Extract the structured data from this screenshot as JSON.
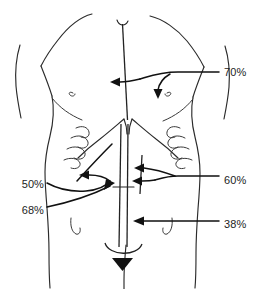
{
  "figure": {
    "type": "anatomical-line-diagram",
    "background_color": "#ffffff",
    "ink_color": "#222222",
    "label_color": "#1d1d1d"
  },
  "annotations": [
    {
      "id": "upper-midline",
      "value": "70%",
      "label_x": 224,
      "label_y": 72,
      "anchor": "start",
      "target": "upper midline / epigastric incision",
      "arrow_branches": 2
    },
    {
      "id": "right-paramedian-upper",
      "value": "60%",
      "label_x": 224,
      "label_y": 180,
      "anchor": "start",
      "target": "right paramedian incision",
      "arrow_branches": 2
    },
    {
      "id": "lower-midline",
      "value": "38%",
      "label_x": 224,
      "label_y": 224,
      "anchor": "start",
      "target": "lower midline / infraumbilical incision",
      "arrow_branches": 1
    },
    {
      "id": "subcostal-left",
      "value": "50%",
      "label_x": 44,
      "label_y": 185,
      "anchor": "end",
      "target": "left subcostal approach",
      "arrow_branches": 2
    },
    {
      "id": "umbilical-left",
      "value": "68%",
      "label_x": 44,
      "label_y": 212,
      "anchor": "end",
      "target": "periumbilical midline",
      "arrow_branches": 1
    }
  ],
  "anatomy_parts": [
    {
      "id": "torso-outline-left",
      "name": "left torso outline"
    },
    {
      "id": "torso-outline-right",
      "name": "right torso outline"
    },
    {
      "id": "left-shoulder",
      "name": "left shoulder contour"
    },
    {
      "id": "right-shoulder",
      "name": "right shoulder contour"
    },
    {
      "id": "left-nipple",
      "name": "left nipple marking"
    },
    {
      "id": "right-nipple",
      "name": "right nipple marking"
    },
    {
      "id": "left-costal-margin",
      "name": "left costal margin ribs"
    },
    {
      "id": "right-costal-margin",
      "name": "right costal margin ribs"
    },
    {
      "id": "left-hip-crease",
      "name": "left hip crease"
    },
    {
      "id": "right-hip-crease",
      "name": "right hip crease"
    },
    {
      "id": "groin-midline",
      "name": "groin midline fold"
    },
    {
      "id": "midline-incision",
      "name": "vertical midline incision"
    },
    {
      "id": "paramedian-incision",
      "name": "right paramedian incision"
    },
    {
      "id": "umbilicus",
      "name": "umbilicus arc"
    }
  ]
}
